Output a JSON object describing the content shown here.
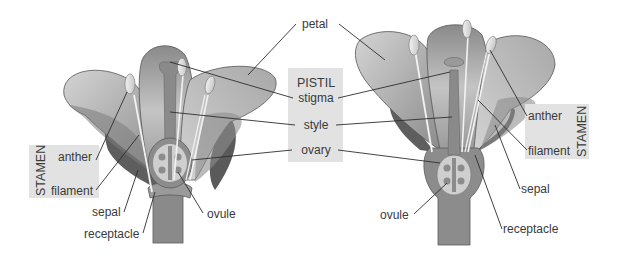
{
  "diagram": {
    "type": "flower-anatomy",
    "colors": {
      "background": "#ffffff",
      "label_box": "#e2e2e2",
      "text": "#3a3a3a",
      "petal_light": "#c8c8c8",
      "petal_mid": "#9a9a9a",
      "petal_dark": "#6e6e6e",
      "sepal": "#5e5e5e",
      "stem": "#8a8a8a",
      "ovary_inner": "#cfcfcf",
      "anther": "#e6e6e6"
    },
    "center_labels": {
      "petal": "petal",
      "pistil_group": {
        "title": "PISTIL",
        "items": [
          "stigma",
          "style",
          "ovary"
        ]
      }
    },
    "left_flower": {
      "stamen_group": {
        "title": "STAMEN",
        "items": [
          "anther",
          "filament"
        ]
      },
      "other_labels": {
        "sepal": "sepal",
        "receptacle": "receptacle",
        "ovule": "ovule"
      }
    },
    "right_flower": {
      "stamen_group": {
        "title": "STAMEN",
        "items": [
          "anther",
          "filament"
        ]
      },
      "other_labels": {
        "sepal": "sepal",
        "receptacle": "receptacle",
        "ovule": "ovule"
      }
    }
  }
}
